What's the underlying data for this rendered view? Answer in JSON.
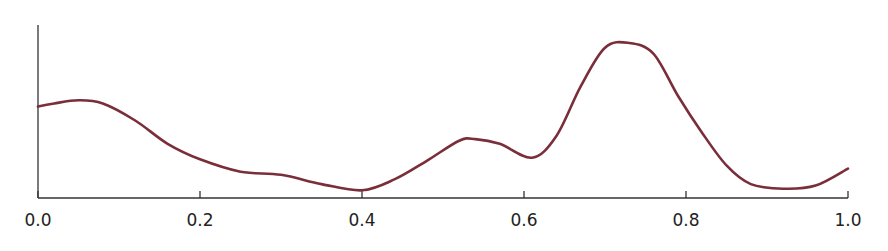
{
  "chart_data": {
    "type": "line",
    "title": "",
    "xlabel": "",
    "ylabel": "",
    "xlim": [
      0.0,
      1.0
    ],
    "ylim": [
      0,
      1.12
    ],
    "grid": false,
    "legend": null,
    "x_ticks": [
      "0.0",
      "0.2",
      "0.4",
      "0.6",
      "0.8",
      "1.0"
    ],
    "y_ticks": [],
    "series": [
      {
        "name": "density",
        "color": "#7a2e3a",
        "x": [
          0.0,
          0.02,
          0.05,
          0.08,
          0.12,
          0.16,
          0.2,
          0.25,
          0.3,
          0.35,
          0.4,
          0.44,
          0.48,
          0.52,
          0.54,
          0.57,
          0.61,
          0.64,
          0.67,
          0.7,
          0.73,
          0.76,
          0.79,
          0.82,
          0.85,
          0.88,
          0.92,
          0.96,
          1.0
        ],
        "values": [
          0.59,
          0.61,
          0.63,
          0.61,
          0.5,
          0.35,
          0.25,
          0.17,
          0.15,
          0.09,
          0.05,
          0.12,
          0.24,
          0.37,
          0.38,
          0.35,
          0.26,
          0.4,
          0.72,
          0.97,
          1.0,
          0.93,
          0.66,
          0.42,
          0.21,
          0.09,
          0.06,
          0.08,
          0.19
        ]
      }
    ]
  }
}
